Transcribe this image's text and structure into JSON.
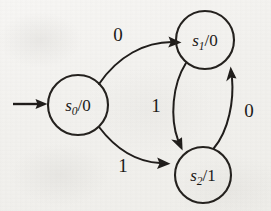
{
  "diagram": {
    "type": "finite-state-machine",
    "background_color": "#f2f1ee",
    "ink_color": "#1f1c1a",
    "start_marker": {
      "name": "initial-state-arrow",
      "points_to": "s0",
      "label": ""
    },
    "states": [
      {
        "id": "s0",
        "name": "state-s0",
        "state_text": "s",
        "subscript": "0",
        "separator": "/",
        "output": "0",
        "full_label": "s0/0",
        "cx": 78,
        "cy": 105,
        "r": 30,
        "is_initial": true
      },
      {
        "id": "s1",
        "name": "state-s1",
        "state_text": "s",
        "subscript": "1",
        "separator": "/",
        "output": "0",
        "full_label": "s1/0",
        "cx": 205,
        "cy": 40,
        "r": 29,
        "is_initial": false
      },
      {
        "id": "s2",
        "name": "state-s2",
        "state_text": "s",
        "subscript": "2",
        "separator": "/",
        "output": "1",
        "full_label": "s2/1",
        "cx": 203,
        "cy": 175,
        "r": 28,
        "is_initial": false
      }
    ],
    "transitions": [
      {
        "id": "t-s0-s1",
        "name": "transition-s0-to-s1",
        "from": "s0",
        "to": "s1",
        "input": "0",
        "label_x": 118,
        "label_y": 41
      },
      {
        "id": "t-s0-s2",
        "name": "transition-s0-to-s2",
        "from": "s0",
        "to": "s2",
        "input": "1",
        "label_x": 123,
        "label_y": 172
      },
      {
        "id": "t-s1-s2",
        "name": "transition-s1-to-s2",
        "from": "s1",
        "to": "s2",
        "input": "1",
        "label_x": 156,
        "label_y": 112
      },
      {
        "id": "t-s2-s1",
        "name": "transition-s2-to-s1",
        "from": "s2",
        "to": "s1",
        "input": "0",
        "label_x": 249,
        "label_y": 117
      }
    ]
  }
}
